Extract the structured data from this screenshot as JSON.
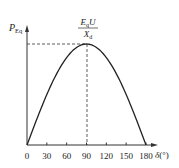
{
  "chart_data": {
    "type": "line",
    "title": "",
    "xlabel": "δ(°)",
    "ylabel": "P_Eq",
    "ylabel_main": "P",
    "ylabel_sub": "Eq",
    "xlabel_symbol": "δ",
    "xlabel_unit": "(°)",
    "x_ticks": [
      0,
      30,
      60,
      90,
      120,
      150,
      180
    ],
    "x_tick_labels": [
      "0",
      "30",
      "60",
      "90",
      "120",
      "150",
      "180"
    ],
    "xlim": [
      0,
      180
    ],
    "ylim": [
      0,
      1
    ],
    "grid": false,
    "legend": null,
    "series": [
      {
        "name": "P_Eq = (E_q U / X_d) sin δ",
        "x": [
          0,
          15,
          30,
          45,
          60,
          75,
          90,
          105,
          120,
          135,
          150,
          165,
          180
        ],
        "values": [
          0,
          0.259,
          0.5,
          0.707,
          0.866,
          0.966,
          1.0,
          0.966,
          0.866,
          0.707,
          0.5,
          0.259,
          0
        ]
      }
    ],
    "annotations": [
      {
        "text": "E_q U / X_d",
        "numerator_main": "E",
        "numerator_sub": "q",
        "numerator_rest": "U",
        "denominator_main": "X",
        "denominator_sub": "d",
        "x": 90,
        "y": 1.0,
        "description": "peak value at δ = 90°, marked with dashed guide lines to both axes"
      }
    ]
  }
}
